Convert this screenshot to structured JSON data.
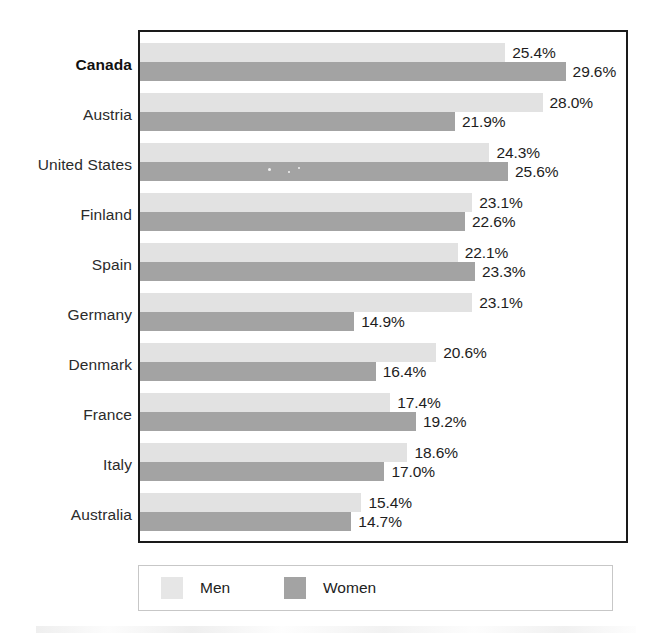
{
  "chart_data": {
    "type": "bar",
    "orientation": "horizontal",
    "grouped": true,
    "title": "",
    "subtitle": "",
    "xlabel": "",
    "ylabel": "",
    "grid": false,
    "value_suffix": "%",
    "xlim": [
      0,
      33.8
    ],
    "categories": [
      "Canada",
      "Austria",
      "United States",
      "Finland",
      "Spain",
      "Germany",
      "Denmark",
      "France",
      "Italy",
      "Australia"
    ],
    "highlighted_category": "Canada",
    "series": [
      {
        "name": "Men",
        "color": "#e2e2e2",
        "values": [
          25.4,
          28.0,
          24.3,
          23.1,
          22.1,
          23.1,
          20.6,
          17.4,
          18.6,
          15.4
        ],
        "labels": [
          "25.4%",
          "28.0%",
          "24.3%",
          "23.1%",
          "22.1%",
          "23.1%",
          "20.6%",
          "17.4%",
          "18.6%",
          "15.4%"
        ]
      },
      {
        "name": "Women",
        "color": "#a3a3a3",
        "values": [
          29.6,
          21.9,
          25.6,
          22.6,
          23.3,
          14.9,
          16.4,
          19.2,
          17.0,
          14.7
        ],
        "labels": [
          "29.6%",
          "21.9%",
          "25.6%",
          "22.6%",
          "23.3%",
          "14.9%",
          "16.4%",
          "19.2%",
          "17.0%",
          "14.7%"
        ]
      }
    ],
    "legend": {
      "position": "bottom",
      "entries": [
        {
          "label": "Men",
          "color": "#e2e2e2"
        },
        {
          "label": "Women",
          "color": "#a3a3a3"
        }
      ]
    }
  }
}
